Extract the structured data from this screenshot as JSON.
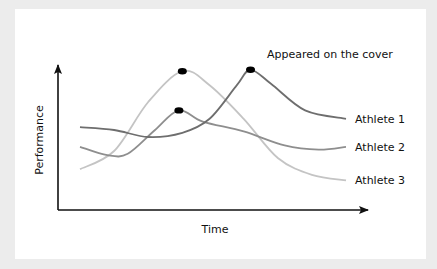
{
  "chart_data": {
    "type": "line",
    "title": "",
    "xlabel": "Time",
    "ylabel": "Performance",
    "xlim": [
      0,
      100
    ],
    "ylim": [
      0,
      100
    ],
    "grid": false,
    "legend": "inline-right",
    "annotation": "Appeared on the cover",
    "series": [
      {
        "name": "Athlete 1",
        "color": "#6e6e6e",
        "points": [
          [
            0,
            52
          ],
          [
            10,
            50
          ],
          [
            20,
            45
          ],
          [
            30,
            48
          ],
          [
            38,
            58
          ],
          [
            46,
            82
          ],
          [
            50,
            93
          ],
          [
            56,
            83
          ],
          [
            66,
            64
          ],
          [
            78,
            58
          ]
        ],
        "marker": [
          50,
          93
        ]
      },
      {
        "name": "Athlete 2",
        "color": "#8e8e8e",
        "points": [
          [
            0,
            38
          ],
          [
            8,
            32
          ],
          [
            14,
            33
          ],
          [
            22,
            50
          ],
          [
            29,
            64
          ],
          [
            36,
            56
          ],
          [
            48,
            49
          ],
          [
            60,
            39
          ],
          [
            70,
            36
          ],
          [
            78,
            38
          ]
        ],
        "marker": [
          29,
          64
        ]
      },
      {
        "name": "Athlete 3",
        "color": "#c4c4c4",
        "points": [
          [
            0,
            22
          ],
          [
            10,
            35
          ],
          [
            20,
            70
          ],
          [
            30,
            92
          ],
          [
            38,
            82
          ],
          [
            48,
            58
          ],
          [
            58,
            30
          ],
          [
            68,
            18
          ],
          [
            78,
            14
          ]
        ],
        "marker": [
          30,
          92
        ]
      }
    ]
  }
}
